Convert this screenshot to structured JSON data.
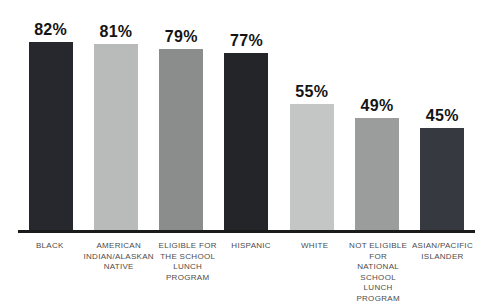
{
  "chart_data": {
    "type": "bar",
    "title": "",
    "xlabel": "",
    "ylabel": "",
    "ylim": [
      0,
      100
    ],
    "grid": false,
    "legend": "none",
    "value_suffix": "%",
    "categories": [
      "BLACK",
      "AMERICAN INDIAN/ALASKAN NATIVE",
      "ELIGIBLE FOR THE SCHOOL LUNCH PROGRAM",
      "HISPANIC",
      "WHITE",
      "NOT ELIGIBLE FOR NATIONAL SCHOOL LUNCH PROGRAM",
      "ASIAN/PACIFIC ISLANDER"
    ],
    "values": [
      82,
      81,
      79,
      77,
      55,
      49,
      45
    ],
    "axis_color": "#1b1b1b",
    "bars": [
      {
        "category_display": "BLACK",
        "value": 82,
        "value_label": "82%",
        "color": "#26282d"
      },
      {
        "category_display": "AMERICAN\nINDIAN/ALASKAN\nNATIVE",
        "value": 81,
        "value_label": "81%",
        "color": "#b9bbba"
      },
      {
        "category_display": "ELIGIBLE FOR\nTHE SCHOOL\nLUNCH\nPROGRAM",
        "value": 79,
        "value_label": "79%",
        "color": "#8b8d8c"
      },
      {
        "category_display": "HISPANIC",
        "value": 77,
        "value_label": "77%",
        "color": "#232528"
      },
      {
        "category_display": "WHITE",
        "value": 55,
        "value_label": "55%",
        "color": "#c4c6c5"
      },
      {
        "category_display": "NOT ELIGIBLE\nFOR NATIONAL\nSCHOOL LUNCH\nPROGRAM",
        "value": 49,
        "value_label": "49%",
        "color": "#9b9d9c"
      },
      {
        "category_display": "ASIAN/PACIFIC\nISLANDER",
        "value": 45,
        "value_label": "45%",
        "color": "#363a40"
      }
    ]
  }
}
